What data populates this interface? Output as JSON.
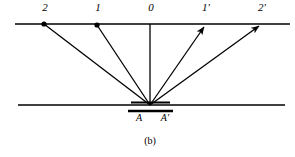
{
  "figure": {
    "caption": "(b)",
    "caption_x": 150,
    "caption_y": 137,
    "background_color": "#ffffff",
    "ink_color": "#000000",
    "width": 295,
    "height": 157
  },
  "screen_line": {
    "name": "upper-screen-line",
    "x1": 15,
    "x2": 290,
    "y": 24,
    "stroke_width": 1.6
  },
  "grating_line": {
    "name": "lower-grating-line",
    "x1": 18,
    "x2": 285,
    "y": 105,
    "stroke_width": 1.6
  },
  "aperture": {
    "name": "slit-aperture",
    "bar_top_x1": 131,
    "bar_top_x2": 170,
    "bar_top_y": 103,
    "bar_bottom_x1": 128,
    "bar_bottom_x2": 173,
    "bar_bottom_y": 111,
    "bar_stroke_width": 2.2,
    "vertex_x": 150,
    "vertex_y": 105,
    "label_left": "A",
    "label_left_x": 139,
    "label_left_y": 114,
    "label_right": "A′",
    "label_right_x": 165,
    "label_right_y": 114
  },
  "rays": [
    {
      "id": "ray-order-2",
      "label": "2",
      "label_x": 45,
      "label_y": 8,
      "end_x": 44,
      "end_y": 24,
      "marker": "dot",
      "side": "left"
    },
    {
      "id": "ray-order-1",
      "label": "1",
      "label_x": 98,
      "label_y": 8,
      "end_x": 97,
      "end_y": 25,
      "marker": "dot",
      "side": "left"
    },
    {
      "id": "ray-order-0",
      "label": "0",
      "label_x": 151,
      "label_y": 8,
      "end_x": 150,
      "end_y": 24,
      "marker": "none",
      "side": "center"
    },
    {
      "id": "ray-order-1-prime",
      "label": "1′",
      "label_x": 206,
      "label_y": 8,
      "end_x": 206,
      "end_y": 25,
      "marker": "arrow",
      "side": "right"
    },
    {
      "id": "ray-order-2-prime",
      "label": "2′",
      "label_x": 262,
      "label_y": 8,
      "end_x": 262,
      "end_y": 24,
      "marker": "arrow",
      "side": "right"
    }
  ],
  "marker_dot_radius": 2.6,
  "ray_stroke_width": 1.3
}
